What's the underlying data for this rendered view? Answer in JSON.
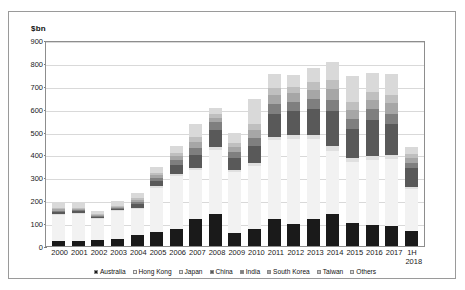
{
  "figure": {
    "unit_label": "$bn"
  },
  "chart_data": {
    "type": "bar",
    "stacked": true,
    "title": "",
    "subtitle": "",
    "xlabel": "",
    "ylabel": "$bn",
    "ylim": [
      0,
      900
    ],
    "ytick_step": 100,
    "yticks": [
      900,
      800,
      700,
      600,
      500,
      400,
      300,
      200,
      100,
      0
    ],
    "grid": true,
    "legend_position": "bottom",
    "categories": [
      "2000",
      "2001",
      "2002",
      "2003",
      "2004",
      "2005",
      "2006",
      "2007",
      "2008",
      "2009",
      "2010",
      "2011",
      "2012",
      "2013",
      "2014",
      "2015",
      "2016",
      "2017",
      "1H\n2018"
    ],
    "series": [
      {
        "name": "Australia",
        "color": "#1a1a1a",
        "values": [
          22,
          20,
          27,
          32,
          50,
          60,
          73,
          117,
          138,
          58,
          76,
          117,
          96,
          119,
          138,
          101,
          94,
          89,
          64
        ]
      },
      {
        "name": "Hong Kong",
        "color": "#f2f2f2",
        "values": [
          112,
          120,
          91,
          120,
          112,
          193,
          232,
          213,
          283,
          266,
          274,
          345,
          372,
          348,
          275,
          267,
          281,
          291,
          183
        ]
      },
      {
        "name": "Japan",
        "color": "#e0e0e0",
        "values": [
          5,
          4,
          4,
          4,
          6,
          8,
          9,
          10,
          11,
          9,
          13,
          16,
          19,
          20,
          22,
          16,
          18,
          19,
          9
        ]
      },
      {
        "name": "China",
        "color": "#595959",
        "values": [
          9,
          7,
          5,
          6,
          16,
          22,
          40,
          57,
          75,
          53,
          73,
          99,
          103,
          113,
          155,
          127,
          158,
          133,
          85
        ]
      },
      {
        "name": "India",
        "color": "#7f7f7f",
        "values": [
          7,
          5,
          4,
          5,
          10,
          14,
          22,
          33,
          34,
          26,
          36,
          44,
          40,
          41,
          48,
          44,
          46,
          47,
          24
        ]
      },
      {
        "name": "South Korea",
        "color": "#a6a6a6",
        "values": [
          6,
          5,
          4,
          5,
          9,
          12,
          17,
          25,
          20,
          21,
          35,
          38,
          37,
          41,
          49,
          41,
          42,
          44,
          20
        ]
      },
      {
        "name": "Taiwan",
        "color": "#bfbfbf",
        "values": [
          6,
          5,
          4,
          5,
          8,
          11,
          14,
          21,
          15,
          17,
          27,
          30,
          29,
          33,
          40,
          33,
          35,
          36,
          16
        ]
      },
      {
        "name": "Others",
        "color": "#d9d9d9",
        "values": [
          22,
          21,
          13,
          18,
          21,
          24,
          28,
          56,
          29,
          43,
          108,
          63,
          52,
          64,
          76,
          112,
          84,
          94,
          34
        ]
      }
    ],
    "totals": [
      189,
      187,
      152,
      195,
      232,
      344,
      435,
      532,
      605,
      493,
      642,
      752,
      748,
      779,
      803,
      741,
      758,
      753,
      435
    ]
  },
  "legend": {
    "items": [
      {
        "label": "Australia",
        "color": "#1a1a1a"
      },
      {
        "label": "Hong Kong",
        "color": "#f2f2f2"
      },
      {
        "label": "Japan",
        "color": "#e0e0e0"
      },
      {
        "label": "China",
        "color": "#595959"
      },
      {
        "label": "India",
        "color": "#7f7f7f"
      },
      {
        "label": "South Korea",
        "color": "#a6a6a6"
      },
      {
        "label": "Taiwan",
        "color": "#bfbfbf"
      },
      {
        "label": "Others",
        "color": "#d9d9d9"
      }
    ]
  }
}
